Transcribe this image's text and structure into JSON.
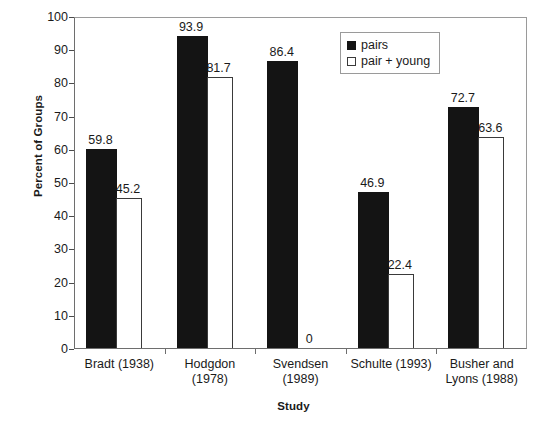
{
  "chart_data": {
    "type": "bar",
    "title": "",
    "xlabel": "Study",
    "ylabel": "Percent of Groups",
    "ylim": [
      0,
      100
    ],
    "ytick_step": 10,
    "yticks": [
      "100",
      "90",
      "80",
      "70",
      "60",
      "50",
      "40",
      "30",
      "20",
      "10",
      "0"
    ],
    "grid": false,
    "legend_position": "top-right",
    "categories": [
      "Bradt (1938)",
      "Hodgdon\n(1978)",
      "Svendsen\n(1989)",
      "Schulte (1993)",
      "Busher and\nLyons (1988)"
    ],
    "series": [
      {
        "name": "pairs",
        "style": "filled",
        "color": "#141414",
        "values": [
          59.8,
          93.9,
          86.4,
          46.9,
          72.7
        ],
        "labels": [
          "59.8",
          "93.9",
          "86.4",
          "46.9",
          "72.7"
        ]
      },
      {
        "name": "pair + young",
        "style": "open",
        "color": "#ffffff",
        "values": [
          45.2,
          81.7,
          0,
          22.4,
          63.6
        ],
        "labels": [
          "45.2",
          "81.7",
          "0",
          "22.4",
          "63.6"
        ]
      }
    ]
  },
  "legend": {
    "items": [
      {
        "label": "pairs",
        "swatch": "filled"
      },
      {
        "label": "pair + young",
        "swatch": "open"
      }
    ]
  }
}
